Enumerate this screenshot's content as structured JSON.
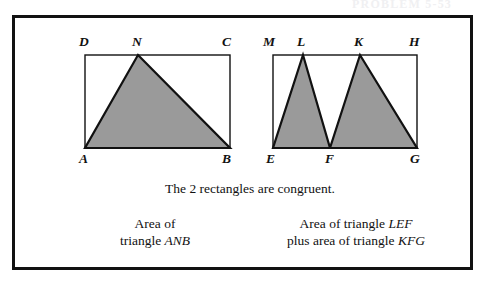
{
  "page": {
    "width": 489,
    "height": 281,
    "background": "#ffffff",
    "border_color": "#111111",
    "shade_color": "#9a9a9a",
    "stroke_color": "#111111"
  },
  "header": {
    "cut_off_text": "PROBLEM 5-53"
  },
  "figure": {
    "left_rectangle": {
      "name": "rectangle-ABCD",
      "vertices": {
        "D": {
          "label": "D",
          "x": 85,
          "y": 55
        },
        "C": {
          "label": "C",
          "x": 230,
          "y": 55
        },
        "A": {
          "label": "A",
          "x": 85,
          "y": 148
        },
        "B": {
          "label": "B",
          "x": 230,
          "y": 148
        }
      },
      "triangle": {
        "name": "triangle-ANB",
        "label": "ANB",
        "apex": {
          "label": "N",
          "x": 138,
          "y": 55
        },
        "base_left": "A",
        "base_right": "B",
        "shaded": true
      }
    },
    "right_rectangle": {
      "name": "rectangle-EGHM",
      "vertices": {
        "M": {
          "label": "M",
          "x": 273,
          "y": 55
        },
        "H": {
          "label": "H",
          "x": 417,
          "y": 55
        },
        "E": {
          "label": "E",
          "x": 273,
          "y": 148
        },
        "G": {
          "label": "G",
          "x": 417,
          "y": 148
        }
      },
      "midpoint": {
        "label": "F",
        "x": 330,
        "y": 148
      },
      "triangles": [
        {
          "name": "triangle-LEF",
          "label": "LEF",
          "apex": {
            "label": "L",
            "x": 303,
            "y": 55
          },
          "base_left": "E",
          "base_right": "F",
          "shaded": true
        },
        {
          "name": "triangle-KFG",
          "label": "KFG",
          "apex": {
            "label": "K",
            "x": 360,
            "y": 55
          },
          "base_left": "F",
          "base_right": "G",
          "shaded": true
        }
      ]
    },
    "vertex_labels": [
      {
        "id": "label-D",
        "text": "D",
        "x": 79,
        "y": 34
      },
      {
        "id": "label-N",
        "text": "N",
        "x": 132,
        "y": 34
      },
      {
        "id": "label-C",
        "text": "C",
        "x": 222,
        "y": 34
      },
      {
        "id": "label-M",
        "text": "M",
        "x": 263,
        "y": 34
      },
      {
        "id": "label-L",
        "text": "L",
        "x": 296,
        "y": 34
      },
      {
        "id": "label-K",
        "text": "K",
        "x": 353,
        "y": 34
      },
      {
        "id": "label-H",
        "text": "H",
        "x": 409,
        "y": 34
      },
      {
        "id": "label-A",
        "text": "A",
        "x": 79,
        "y": 151
      },
      {
        "id": "label-B",
        "text": "B",
        "x": 222,
        "y": 151
      },
      {
        "id": "label-E",
        "text": "E",
        "x": 266,
        "y": 151
      },
      {
        "id": "label-F",
        "text": "F",
        "x": 324,
        "y": 151
      },
      {
        "id": "label-G",
        "text": "G",
        "x": 410,
        "y": 151
      }
    ]
  },
  "captions": {
    "congruent_note": "The 2 rectangles are congruent.",
    "left": {
      "line1": "Area of",
      "line2_prefix": "triangle ",
      "line2_italic": "ANB"
    },
    "right": {
      "line1_prefix": "Area of triangle ",
      "line1_italic": "LEF",
      "line2_prefix": "plus area of triangle ",
      "line2_italic": "KFG"
    }
  }
}
